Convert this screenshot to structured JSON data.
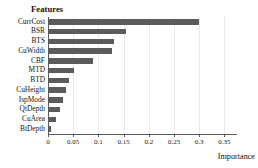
{
  "chart_data": {
    "type": "bar",
    "orientation": "horizontal",
    "title": "Features",
    "xlabel": "Importance",
    "ylabel": "",
    "xlim": [
      0,
      0.375
    ],
    "xticks": [
      0,
      0.05,
      0.1,
      0.15,
      0.2,
      0.25,
      0.3,
      0.35
    ],
    "xticklabels": [
      "0",
      "0.05",
      "0.1",
      "0.15",
      "0.2",
      "0.25",
      "0.3",
      "0.35"
    ],
    "grid": true,
    "legend": null,
    "bar_color": "#5b5b5b",
    "categories": [
      "CurrCost",
      "BSR",
      "BTS",
      "CuWidth",
      "CBF",
      "MTD",
      "BTD",
      "CuHeight",
      "IspMode",
      "QtDepth",
      "CuArea",
      "BtDepth"
    ],
    "values": [
      0.3,
      0.155,
      0.131,
      0.126,
      0.089,
      0.051,
      0.041,
      0.035,
      0.03,
      0.024,
      0.015,
      0.005
    ]
  }
}
